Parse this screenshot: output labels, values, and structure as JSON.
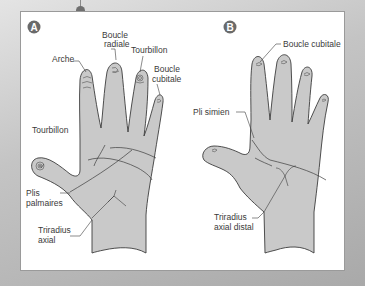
{
  "figure": {
    "panels": [
      {
        "id": "A",
        "badge": "A",
        "labels": {
          "boucle_radiale_1": "Boucle",
          "boucle_radiale_2": "radiale",
          "arche": "Arche",
          "tourbillon_finger": "Tourbillon",
          "boucle_cubitale_1": "Boucle",
          "boucle_cubitale_2": "cubitale",
          "tourbillon_thumb": "Tourbillon",
          "plis_1": "Plis",
          "plis_2": "palmaires",
          "triradius_1": "Triradius",
          "triradius_2": "axial"
        }
      },
      {
        "id": "B",
        "badge": "B",
        "labels": {
          "boucle_cubitale": "Boucle cubitale",
          "pli_simien": "Pli simien",
          "triradius_1": "Triradius",
          "triradius_2": "axial distal"
        }
      }
    ],
    "colors": {
      "hand_fill": "#c9c9c9",
      "outline": "#3c3c3c",
      "badge": "#6a6a6a",
      "panel": "#ffffff"
    }
  }
}
